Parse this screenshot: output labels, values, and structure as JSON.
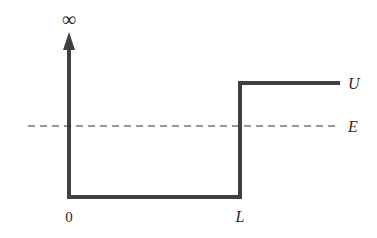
{
  "diagram": {
    "type": "potential-well",
    "labels": {
      "infinity": "∞",
      "origin": "0",
      "length": "L",
      "barrier": "U",
      "energy": "E"
    },
    "colors": {
      "potential_line": "#404040",
      "energy_line": "#333333",
      "text": "#2a2a2a"
    }
  }
}
